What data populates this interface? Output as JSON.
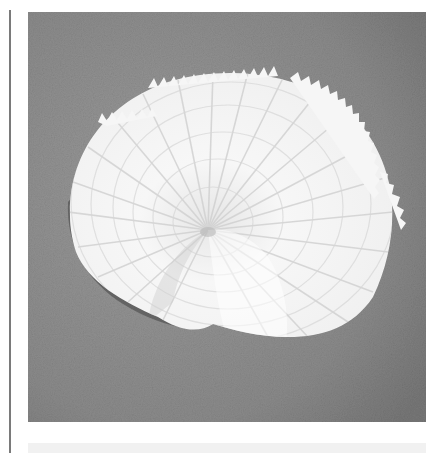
{
  "image": {
    "subject": "white paper nautilus (argonaut) shell on gray textured background",
    "alt": "Paper nautilus shell photograph",
    "colors": {
      "background_gray": "#8e8e8e",
      "background_dark": "#6f6f6f",
      "shell_white": "#f4f4f4",
      "shell_shadow": "#d9d9d9",
      "rule_gray": "#7a7a7a",
      "strip_gray": "#f1f1f1"
    }
  }
}
